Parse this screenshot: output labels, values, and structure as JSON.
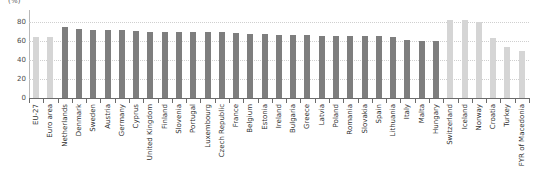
{
  "chart_data": {
    "type": "bar",
    "title": "",
    "unit_label": "(%)",
    "xlabel": "",
    "ylabel": "",
    "ylim": [
      0,
      80
    ],
    "yticks": [
      0,
      20,
      40,
      60,
      80
    ],
    "grid": true,
    "legend": "none",
    "categories": [
      "EU-27",
      "Euro area",
      "Netherlands",
      "Denmark",
      "Sweden",
      "Austria",
      "Germany",
      "Cyprus",
      "United Kingdom",
      "Finland",
      "Slovenia",
      "Portugal",
      "Luxembourg",
      "Czech Republic",
      "France",
      "Belgium",
      "Estonia",
      "Ireland",
      "Bulgaria",
      "Greece",
      "Latvia",
      "Poland",
      "Romania",
      "Slovakia",
      "Spain",
      "Lithuania",
      "Italy",
      "Malta",
      "Hungary",
      "Switzerland",
      "Iceland",
      "Norway",
      "Croatia",
      "Turkey",
      "FYR of Macedonia"
    ],
    "values": [
      64,
      64,
      75,
      73,
      72,
      72,
      72,
      71,
      70,
      70,
      70,
      69,
      69,
      69,
      68,
      67,
      67,
      66,
      66,
      66,
      65,
      65,
      65,
      65,
      65,
      64,
      61,
      60,
      60,
      82,
      82,
      80,
      63,
      54,
      50
    ],
    "series_colors": {
      "aggregate": "#d5d5d5",
      "member_state": "#7e7e7e",
      "non_member": "#d5d5d5"
    },
    "bar_groups": [
      "aggregate",
      "aggregate",
      "member_state",
      "member_state",
      "member_state",
      "member_state",
      "member_state",
      "member_state",
      "member_state",
      "member_state",
      "member_state",
      "member_state",
      "member_state",
      "member_state",
      "member_state",
      "member_state",
      "member_state",
      "member_state",
      "member_state",
      "member_state",
      "member_state",
      "member_state",
      "member_state",
      "member_state",
      "member_state",
      "member_state",
      "member_state",
      "member_state",
      "member_state",
      "non_member",
      "non_member",
      "non_member",
      "non_member",
      "non_member",
      "non_member"
    ]
  }
}
